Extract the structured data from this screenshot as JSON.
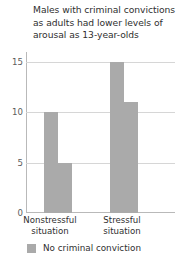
{
  "chart_data": {
    "type": "bar",
    "title": "Males with criminal convictions as adults had lower levels of arousal as 13-year-olds",
    "title_lines": [
      "Males with criminal convictions",
      "as adults had lower levels of",
      "arousal as 13-year-olds"
    ],
    "xlabel": "",
    "ylabel": "",
    "categories": [
      "Nonstressful situation",
      "Stressful situation"
    ],
    "category_lines": [
      [
        "Nonstressful",
        "situation"
      ],
      [
        "Stressful",
        "situation"
      ]
    ],
    "series": [
      {
        "name": "No criminal conviction",
        "color": "#aaaaaa",
        "values": [
          10,
          15
        ]
      },
      {
        "name": "",
        "color": "#aaaaaa",
        "values": [
          5,
          11
        ]
      }
    ],
    "ylim": [
      0,
      16
    ],
    "yticks": [
      0,
      5,
      10,
      15
    ],
    "ytick_labels": [
      "0",
      "5",
      "10",
      "15"
    ],
    "gridlines": [
      5,
      10,
      15
    ],
    "grid": true,
    "legend_position": "below",
    "legend": [
      {
        "label": "No criminal conviction",
        "color": "#aaaaaa"
      }
    ]
  },
  "colors": {
    "bar": "#aaaaaa",
    "grid": "#d6d6d6",
    "axis": "#b9b9b9",
    "text": "#2f2f2f",
    "tick_text": "#5c5c5c",
    "background": "#ffffff"
  }
}
